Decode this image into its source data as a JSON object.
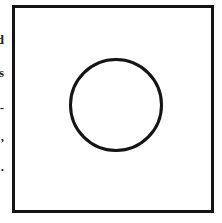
{
  "diagram": {
    "shapes": [
      {
        "type": "square-frame",
        "stroke": "#141414"
      },
      {
        "type": "circle",
        "stroke": "#141414"
      }
    ],
    "edge_fragments": [
      {
        "text": "d",
        "top": 33
      },
      {
        "text": "s",
        "top": 66
      },
      {
        "text": "-",
        "top": 101
      },
      {
        "text": ",",
        "top": 130
      },
      {
        "text": ".",
        "top": 160
      }
    ]
  }
}
